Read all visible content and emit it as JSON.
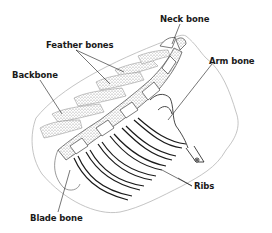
{
  "diagram": {
    "type": "anatomical-illustration",
    "colors": {
      "line": "#1a1a1a",
      "outline": "#b0b0b0",
      "stipple": "#9a9a9a",
      "background": "#ffffff"
    },
    "labels": [
      {
        "id": "neck_bone",
        "text": "Neck bone"
      },
      {
        "id": "feather_bones",
        "text": "Feather bones"
      },
      {
        "id": "backbone",
        "text": "Backbone"
      },
      {
        "id": "arm_bone",
        "text": "Arm bone"
      },
      {
        "id": "ribs",
        "text": "Ribs"
      },
      {
        "id": "blade_bone",
        "text": "Blade bone"
      }
    ]
  }
}
